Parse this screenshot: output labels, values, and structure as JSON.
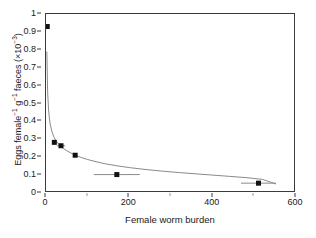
{
  "chart_data": {
    "type": "scatter",
    "title": "",
    "xlabel": "Female worm burden",
    "ylabel_parts": {
      "main_a": "Eggs female",
      "sup_a": "−1",
      "main_b": " g",
      "sup_b": "−1",
      "main_c": " faeces (×10",
      "sup_c": "−3",
      "main_d": ")"
    },
    "ylabel": "Eggs female−1 g−1 faeces (×10−3)",
    "xlim": [
      0,
      600
    ],
    "ylim": [
      0,
      1
    ],
    "xticks": [
      0,
      200,
      400,
      600
    ],
    "xticklabels": [
      "0",
      "200",
      "400",
      "600"
    ],
    "xminorticks": [
      100,
      300,
      500
    ],
    "yticks": [
      0,
      0.1,
      0.2,
      0.3,
      0.4,
      0.5,
      0.6,
      0.7,
      0.8,
      0.9,
      1
    ],
    "yticklabels": [
      "0",
      "0.1",
      "0.2",
      "0.3",
      "0.4",
      "0.5",
      "0.6",
      "0.7",
      "0.8",
      "0.9",
      "1"
    ],
    "grid": false,
    "legend": null,
    "marker": {
      "shape": "square",
      "color": "#111111",
      "size_px": 5,
      "error_bar_color": "#8a8a8a"
    },
    "fit_line": {
      "color": "#8a8a8a",
      "width_px": 1,
      "description": "decaying power-law fit",
      "x_start": 2,
      "x_end": 552,
      "y_at_x_start": 0.79,
      "y_at_x_end": 0.05,
      "points": [
        [
          2,
          0.79
        ],
        [
          4,
          0.56
        ],
        [
          6,
          0.47
        ],
        [
          8,
          0.42
        ],
        [
          10,
          0.385
        ],
        [
          14,
          0.345
        ],
        [
          18,
          0.318
        ],
        [
          22,
          0.3
        ],
        [
          26,
          0.286
        ],
        [
          30,
          0.274
        ],
        [
          36,
          0.26
        ],
        [
          42,
          0.248
        ],
        [
          50,
          0.236
        ],
        [
          60,
          0.223
        ],
        [
          70,
          0.212
        ],
        [
          85,
          0.198
        ],
        [
          100,
          0.187
        ],
        [
          120,
          0.175
        ],
        [
          140,
          0.164
        ],
        [
          170,
          0.152
        ],
        [
          200,
          0.142
        ],
        [
          240,
          0.131
        ],
        [
          280,
          0.122
        ],
        [
          320,
          0.114
        ],
        [
          360,
          0.107
        ],
        [
          400,
          0.1
        ],
        [
          440,
          0.093
        ],
        [
          480,
          0.086
        ],
        [
          520,
          0.076
        ],
        [
          552,
          0.05
        ]
      ]
    },
    "series": [
      {
        "name": "Eggs per female per gram faeces",
        "points": [
          {
            "x": 3,
            "y": 0.93,
            "xerr": 0,
            "yerr": 0
          },
          {
            "x": 20,
            "y": 0.283,
            "xerr": 0,
            "yerr": 0
          },
          {
            "x": 36,
            "y": 0.264,
            "xerr": 10,
            "yerr": 0
          },
          {
            "x": 70,
            "y": 0.211,
            "xerr": 0,
            "yerr": 0
          },
          {
            "x": 170,
            "y": 0.103,
            "xerr": 55,
            "yerr": 0
          },
          {
            "x": 510,
            "y": 0.055,
            "xerr": 42,
            "yerr": 0
          }
        ]
      }
    ]
  }
}
